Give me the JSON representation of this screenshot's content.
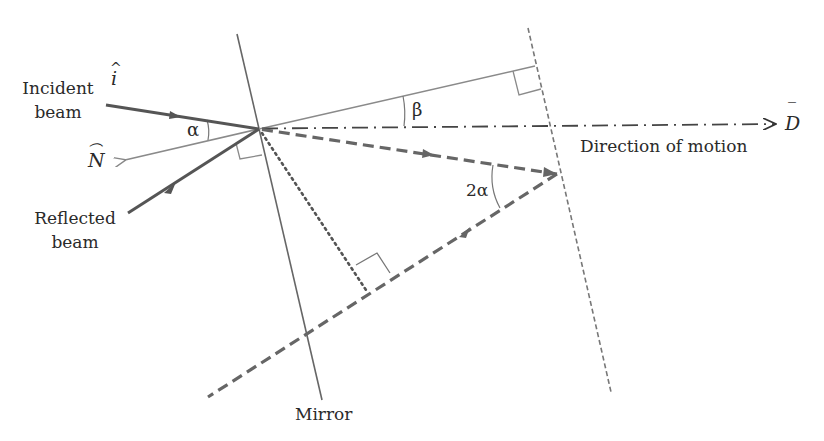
{
  "diagram": {
    "labels": {
      "incident_beam_line1": "Incident",
      "incident_beam_line2": "beam",
      "incident_unit_vector": "i",
      "incident_hat": "^",
      "normal_vector": "N",
      "normal_hat": "⌒",
      "reflected_beam_line1": "Reflected",
      "reflected_beam_line2": "beam",
      "alpha": "α",
      "beta": "β",
      "two_alpha": "2α",
      "direction_vector": "D",
      "direction_overbar": "‾",
      "direction_of_motion": "Direction of motion",
      "mirror": "Mirror"
    },
    "colors": {
      "incident_beam": "#555555",
      "reflected_beam": "#555555",
      "mirror_line": "#666666",
      "normal_line": "#888888",
      "dashed_path": "#666666",
      "text": "#2a2a2a",
      "background": "#ffffff"
    },
    "elements": [
      {
        "name": "incident-beam",
        "style": "solid-thick",
        "from": [
          106,
          105
        ],
        "to": [
          259,
          129
        ],
        "arrow": "mid"
      },
      {
        "name": "reflected-beam",
        "style": "solid-thick",
        "from": [
          259,
          129
        ],
        "to": [
          128,
          213
        ],
        "arrow": "mid"
      },
      {
        "name": "normal-vector",
        "style": "solid-thin",
        "from": [
          259,
          129
        ],
        "to": [
          124,
          160
        ],
        "arrow": "end"
      },
      {
        "name": "mirror",
        "style": "solid",
        "from": [
          237,
          34
        ],
        "to": [
          322,
          400
        ]
      },
      {
        "name": "mirror-displaced",
        "style": "dashed-fine",
        "from": [
          528,
          28
        ],
        "to": [
          611,
          392
        ]
      },
      {
        "name": "upper-perpendicular",
        "style": "solid-thin",
        "from": [
          259,
          129
        ],
        "to": [
          535,
          66
        ]
      },
      {
        "name": "direction-of-motion",
        "style": "dash-dot",
        "from": [
          259,
          129
        ],
        "to": [
          778,
          124
        ],
        "arrow": "end"
      },
      {
        "name": "incident-extension",
        "style": "dashed-thick",
        "from": [
          259,
          129
        ],
        "to": [
          557,
          174
        ],
        "arrow": "mid"
      },
      {
        "name": "returned-beam",
        "style": "dashed-thick",
        "from": [
          557,
          174
        ],
        "to": [
          208,
          397
        ],
        "arrow": "mid"
      },
      {
        "name": "perpendicular-foot",
        "style": "dotted",
        "from": [
          259,
          129
        ],
        "to": [
          366,
          290
        ]
      }
    ]
  }
}
